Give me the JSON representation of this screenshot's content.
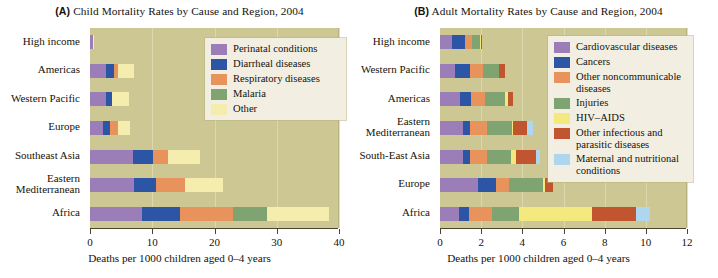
{
  "figure": {
    "axis_title": "Deaths per 1000 children aged 0–4 years"
  },
  "panel_a": {
    "tag": "(A)",
    "title": "Child Mortality Rates by Cause and Region, 2004",
    "axis_title": "Deaths per 1000 children aged 0–4 years"
  },
  "panel_b": {
    "tag": "(B)",
    "title": "Adult Mortality Rates by Cause and Region, 2004",
    "axis_title": "Deaths per 1000 children aged 0–4 years"
  },
  "chart_data": [
    {
      "type": "bar",
      "orientation": "horizontal",
      "stacked": true,
      "panel": "(A)",
      "title": "Child Mortality Rates by Cause and Region, 2004",
      "xlabel": "Deaths per 1000 children aged 0–4 years",
      "ylabel": "",
      "xlim": [
        0,
        40
      ],
      "xticks": [
        0,
        10,
        20,
        30,
        40
      ],
      "ticklabels": [
        "0",
        "10",
        "20",
        "30",
        "40"
      ],
      "grid": true,
      "legend_position": "inside-right",
      "categories": [
        "High income",
        "Americas",
        "Western Pacific",
        "Europe",
        "Southeast Asia",
        "Eastern\nMediterranean",
        "Africa"
      ],
      "series": [
        {
          "name": "Perinatal conditions",
          "color": "#9b7eb8",
          "values": [
            0.45,
            2.5,
            2.5,
            2.1,
            6.9,
            7.0,
            8.3
          ]
        },
        {
          "name": "Diarrheal diseases",
          "color": "#2d55a6",
          "values": [
            0.05,
            1.4,
            1.0,
            1.1,
            3.3,
            3.6,
            6.2
          ]
        },
        {
          "name": "Respiratory diseases",
          "color": "#e8935c",
          "values": [
            0.0,
            0.6,
            0.0,
            1.3,
            2.3,
            4.6,
            8.4
          ]
        },
        {
          "name": "Malaria",
          "color": "#7fa472",
          "values": [
            0.0,
            0.0,
            0.0,
            0.0,
            0.0,
            0.0,
            5.6
          ]
        },
        {
          "name": "Other",
          "color": "#f4edae",
          "values": [
            0.1,
            2.6,
            2.7,
            2.0,
            5.1,
            6.1,
            9.9
          ]
        }
      ],
      "totals": [
        0.6,
        7.1,
        6.2,
        6.5,
        17.6,
        21.3,
        38.4
      ]
    },
    {
      "type": "bar",
      "orientation": "horizontal",
      "stacked": true,
      "panel": "(B)",
      "title": "Adult Mortality Rates by Cause and Region, 2004",
      "xlabel": "Deaths per 1000 children aged 0–4 years",
      "ylabel": "",
      "xlim": [
        0,
        12
      ],
      "xticks": [
        0,
        2,
        4,
        6,
        8,
        10,
        12
      ],
      "ticklabels": [
        "0",
        "2",
        "4",
        "6",
        "8",
        "10",
        "12"
      ],
      "grid": true,
      "legend_position": "inside-right",
      "categories": [
        "High income",
        "Western Pacific",
        "Americas",
        "Eastern\nMediterranean",
        "South-East Asia",
        "Europe",
        "Africa"
      ],
      "series": [
        {
          "name": "Cardiovascular diseases",
          "color": "#9b7eb8",
          "values": [
            0.6,
            0.75,
            0.95,
            1.1,
            1.1,
            1.84,
            0.94
          ]
        },
        {
          "name": "Cancers",
          "color": "#2d55a6",
          "values": [
            0.6,
            0.7,
            0.55,
            0.35,
            0.35,
            0.88,
            0.49
          ]
        },
        {
          "name": "Other noncommunicable diseases",
          "color": "#e8935c",
          "values": [
            0.35,
            0.65,
            0.7,
            0.85,
            0.85,
            0.65,
            1.09
          ]
        },
        {
          "name": "Injuries",
          "color": "#7fa472",
          "values": [
            0.4,
            0.75,
            0.95,
            1.2,
            1.15,
            1.63,
            1.3
          ]
        },
        {
          "name": "HIV–AIDS",
          "color": "#f4e97f",
          "values": [
            0.02,
            0.02,
            0.15,
            0.03,
            0.25,
            0.08,
            3.58
          ]
        },
        {
          "name": "Other infectious and parasitic diseases",
          "color": "#c0552f",
          "values": [
            0.08,
            0.28,
            0.25,
            0.72,
            0.95,
            0.4,
            2.1
          ]
        },
        {
          "name": "Maternal and nutritional conditions",
          "color": "#aed7ef",
          "values": [
            0.0,
            0.0,
            0.0,
            0.25,
            0.2,
            0.0,
            0.7
          ]
        }
      ],
      "totals": [
        2.05,
        3.15,
        3.55,
        4.5,
        4.85,
        5.48,
        10.2
      ]
    }
  ]
}
